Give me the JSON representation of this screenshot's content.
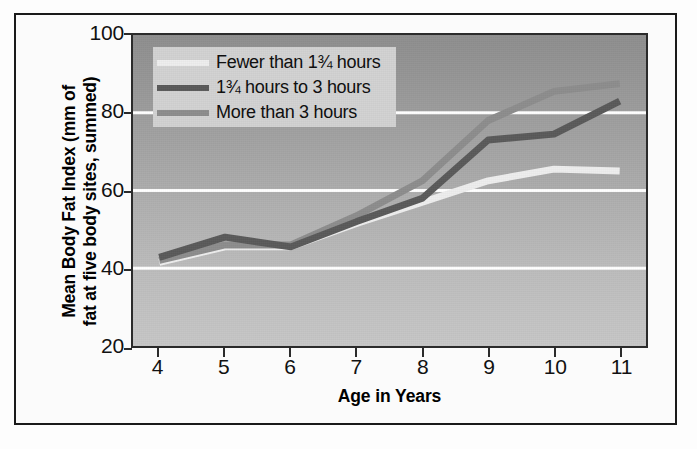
{
  "chart_data": {
    "type": "line",
    "title": "",
    "subtitle": "",
    "xlabel": "Age in Years",
    "ylabel": "Mean Body Fat Index (mm of fat at five body sites, summed)",
    "ylabel_line1": "Mean Body Fat Index (mm of",
    "ylabel_line2": "fat at five body sites, summed)",
    "x": [
      4,
      5,
      6,
      7,
      8,
      9,
      10,
      11
    ],
    "xtick_labels": [
      "4",
      "5",
      "6",
      "7",
      "8",
      "9",
      "10",
      "11"
    ],
    "ytick_labels": [
      "20",
      "40",
      "60",
      "80",
      "100"
    ],
    "yticks": [
      20,
      40,
      60,
      80,
      100
    ],
    "xlim": [
      3.6,
      11.4
    ],
    "ylim": [
      20,
      100
    ],
    "grid": "horizontal-white-at-40-60-80",
    "gridlines": [
      40,
      60,
      80
    ],
    "legend_position": "upper-left-inside",
    "plot_background": "vertical gray gradient, dark at top to light at bottom",
    "series": [
      {
        "name": "Fewer than 1¾ hours",
        "color": "#eeeeee",
        "values": [
          41.5,
          45.5,
          45.5,
          51.5,
          57.0,
          62.5,
          65.5,
          65.0
        ]
      },
      {
        "name": "1¾ hours to 3 hours",
        "color": "#5a5a5a",
        "values": [
          42.8,
          48.0,
          45.5,
          52.0,
          58.0,
          73.0,
          74.5,
          83.0
        ]
      },
      {
        "name": "More than 3 hours",
        "color": "#8d8d8d",
        "values": [
          42.0,
          46.0,
          46.0,
          53.5,
          62.5,
          78.0,
          85.5,
          87.5
        ]
      }
    ]
  },
  "legend": {
    "items": [
      {
        "label": "Fewer than 1¾ hours",
        "color": "#eeeeee"
      },
      {
        "label": "1¾ hours to 3 hours",
        "color": "#5a5a5a"
      },
      {
        "label": "More than 3 hours",
        "color": "#8d8d8d"
      }
    ]
  },
  "axes": {
    "x_title": "Age in Years",
    "y_title_line1": "Mean Body Fat Index (mm of",
    "y_title_line2": "fat at five body sites, summed)",
    "x_ticks": [
      "4",
      "5",
      "6",
      "7",
      "8",
      "9",
      "10",
      "11"
    ],
    "y_ticks": [
      "100",
      "80",
      "60",
      "40",
      "20"
    ]
  },
  "colors": {
    "frame": "#1a1a1a",
    "plot_border": "#2b2b2b",
    "gridline": "#ffffff",
    "legend_background": "#d2d2d2",
    "text": "#000000"
  }
}
